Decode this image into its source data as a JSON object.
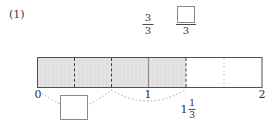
{
  "problem": {
    "number_label": "(1)"
  },
  "number_line": {
    "start_label": "0",
    "one_label": "1",
    "end_label": "2",
    "mixed_number": {
      "whole": "1",
      "numerator": "1",
      "denominator": "3"
    },
    "shaded_fraction_value": "4/3",
    "segments_total": 6,
    "segments_shaded": 4,
    "range": [
      0,
      2
    ],
    "divisions_per_unit": 3
  },
  "top_labels": {
    "fraction_at_one": {
      "numerator": "3",
      "denominator": "3"
    },
    "fraction_blank": {
      "numerator": "",
      "denominator": "3"
    }
  },
  "blanks": {
    "bottom_box_value": "",
    "top_box_value": ""
  },
  "colors": {
    "shade_fill": "#e3e3e3",
    "bar_stroke": "#4f4f4f",
    "divider_dark": "#3d3d3d",
    "divider_light": "#c9c9c9",
    "box_stroke": "#8a8a8a",
    "arc_stroke": "#9a9a9a",
    "text": "#2f2f2f"
  }
}
